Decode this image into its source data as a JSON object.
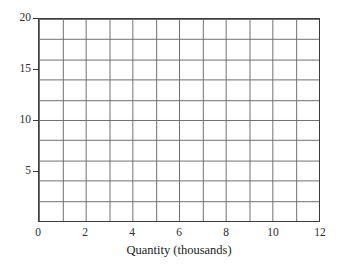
{
  "chart_data": {
    "type": "line",
    "title": "",
    "subtitle": "",
    "xlabel": "Quantity (thousands)",
    "ylabel": "",
    "xlim": [
      0,
      12
    ],
    "ylim": [
      0,
      20
    ],
    "grid": true,
    "legend_position": "none",
    "series": [],
    "annotations": [],
    "note": "Empty grid / blank graph paper template — no data series plotted",
    "x_ticks": [
      {
        "value": 0,
        "label": "0"
      },
      {
        "value": 1,
        "label": ""
      },
      {
        "value": 2,
        "label": "2"
      },
      {
        "value": 3,
        "label": ""
      },
      {
        "value": 4,
        "label": "4"
      },
      {
        "value": 5,
        "label": ""
      },
      {
        "value": 6,
        "label": "6"
      },
      {
        "value": 7,
        "label": ""
      },
      {
        "value": 8,
        "label": "8"
      },
      {
        "value": 9,
        "label": ""
      },
      {
        "value": 10,
        "label": "10"
      },
      {
        "value": 11,
        "label": ""
      },
      {
        "value": 12,
        "label": "12"
      }
    ],
    "y_ticks": [
      {
        "value": 0,
        "label": ""
      },
      {
        "value": 2,
        "label": ""
      },
      {
        "value": 4,
        "label": ""
      },
      {
        "value": 5,
        "label": "5"
      },
      {
        "value": 6,
        "label": ""
      },
      {
        "value": 8,
        "label": ""
      },
      {
        "value": 10,
        "label": "10"
      },
      {
        "value": 12,
        "label": ""
      },
      {
        "value": 14,
        "label": ""
      },
      {
        "value": 15,
        "label": "15"
      },
      {
        "value": 16,
        "label": ""
      },
      {
        "value": 18,
        "label": ""
      },
      {
        "value": 20,
        "label": "20"
      }
    ],
    "x_gridline_step": 1,
    "y_gridline_step": 2,
    "x_labeled_ticks": [
      "0",
      "2",
      "4",
      "6",
      "8",
      "10",
      "12"
    ],
    "y_labeled_ticks": [
      "5",
      "10",
      "15",
      "20"
    ],
    "colors": {
      "grid": "#6e6e6e",
      "frame": "#3c3c3c",
      "background": "#ffffff",
      "text": "#1a1a1a"
    }
  }
}
